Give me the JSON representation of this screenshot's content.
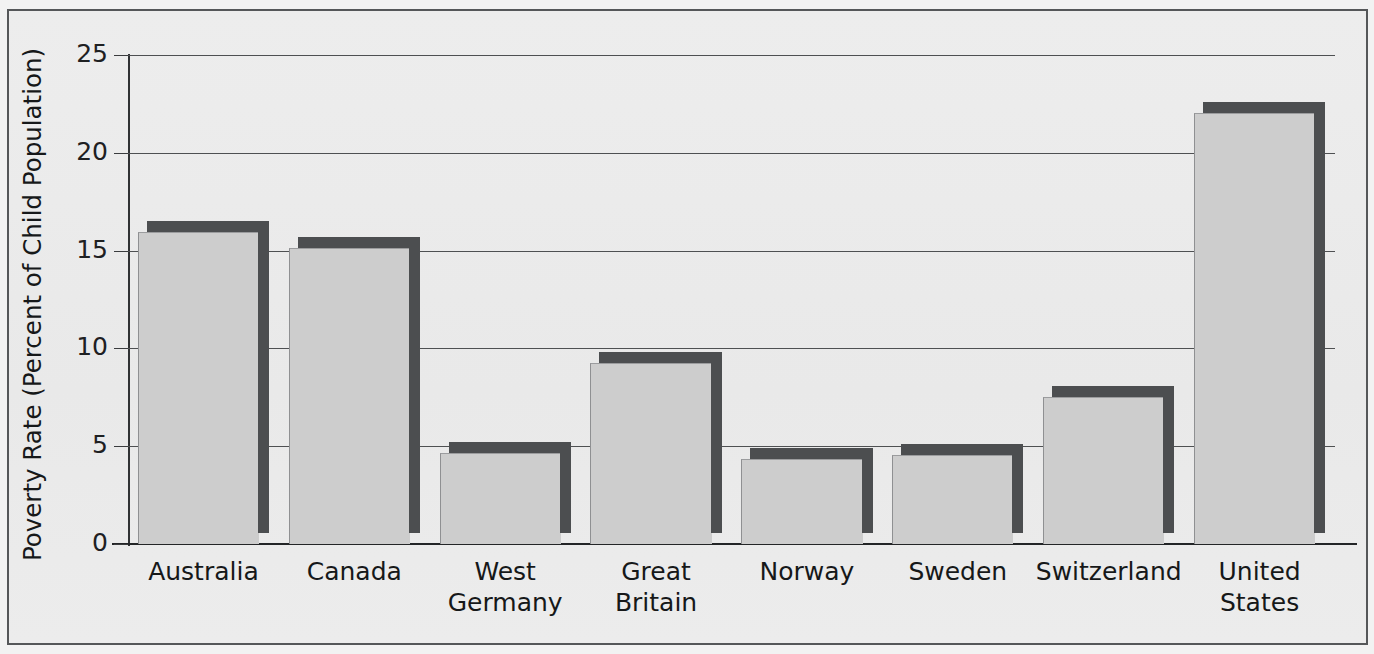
{
  "chart_data": {
    "type": "bar",
    "title": "",
    "xlabel": "",
    "ylabel": "Poverty Rate (Percent of Child Population)",
    "categories": [
      "Australia",
      "Canada",
      "West Germany",
      "Great Britain",
      "Norway",
      "Sweden",
      "Switzerland",
      "United States"
    ],
    "category_lines": [
      [
        "Australia"
      ],
      [
        "Canada"
      ],
      [
        "West",
        "Germany"
      ],
      [
        "Great",
        "Britain"
      ],
      [
        "Norway"
      ],
      [
        "Sweden"
      ],
      [
        "Switzerland"
      ],
      [
        "United",
        "States"
      ]
    ],
    "values": [
      16.5,
      15.7,
      5.2,
      9.8,
      4.9,
      5.1,
      8.1,
      22.6
    ],
    "ylim": [
      0,
      25
    ],
    "yticks": [
      0,
      5,
      10,
      15,
      20,
      25
    ],
    "ytick_labels": [
      "0",
      "5",
      "10",
      "15",
      "20",
      "25"
    ],
    "grid": "horizontal",
    "legend": "none",
    "colors": {
      "bar_face": "#cdcdcd",
      "bar_shadow": "#4c4e50",
      "gridline": "#4e5052",
      "axis": "#232527",
      "background": "#ebebeb",
      "frame_border": "#555759",
      "text": "#161819"
    }
  }
}
